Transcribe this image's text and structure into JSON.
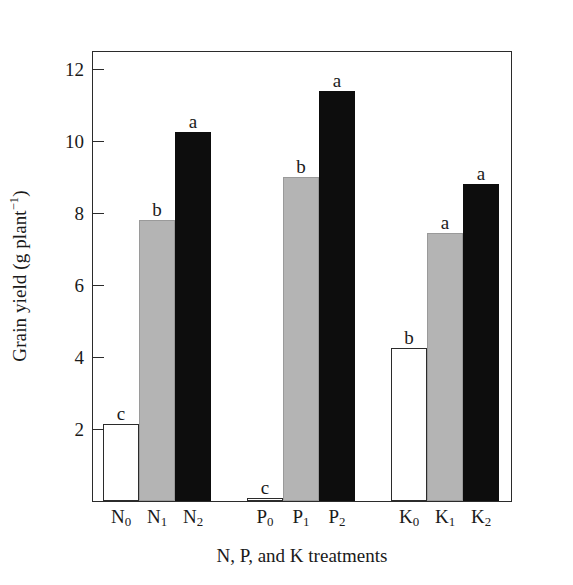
{
  "chart_data": {
    "type": "bar",
    "title": "",
    "xlabel": "N, P, and K treatments",
    "ylabel": "Grain yield (g plant",
    "ylabel_sup": "−1",
    "ylabel_tail": ")",
    "ylabel_plain": "Grain yield (g plant⁻¹)",
    "ylim": [
      0,
      12.5
    ],
    "yticks": [
      2,
      4,
      6,
      8,
      10,
      12
    ],
    "ytick_labels": [
      "2",
      "4",
      "6",
      "8",
      "10",
      "12"
    ],
    "grid": false,
    "legend": "none",
    "categories": [
      "N0",
      "N1",
      "N2",
      "P0",
      "P1",
      "P2",
      "K0",
      "K1",
      "K2"
    ],
    "category_labels": [
      {
        "base": "N",
        "sub": "0"
      },
      {
        "base": "N",
        "sub": "1"
      },
      {
        "base": "N",
        "sub": "2"
      },
      {
        "base": "P",
        "sub": "0"
      },
      {
        "base": "P",
        "sub": "1"
      },
      {
        "base": "P",
        "sub": "2"
      },
      {
        "base": "K",
        "sub": "0"
      },
      {
        "base": "K",
        "sub": "1"
      },
      {
        "base": "K",
        "sub": "2"
      }
    ],
    "values": [
      2.15,
      7.8,
      10.25,
      0.08,
      9.0,
      11.4,
      4.25,
      7.45,
      8.8
    ],
    "annotations": [
      "c",
      "b",
      "a",
      "c",
      "b",
      "a",
      "b",
      "a",
      "a"
    ],
    "fills": [
      "white",
      "gray",
      "black",
      "white",
      "gray",
      "black",
      "white",
      "gray",
      "black"
    ],
    "colors": {
      "white": "#ffffff",
      "gray": "#b4b4b4",
      "black": "#0d0d0d",
      "axis": "#2b2b2b",
      "text": "#1a1a1a"
    },
    "groups": [
      {
        "name": "N",
        "categories": [
          "N0",
          "N1",
          "N2"
        ]
      },
      {
        "name": "P",
        "categories": [
          "P0",
          "P1",
          "P2"
        ]
      },
      {
        "name": "K",
        "categories": [
          "K0",
          "K1",
          "K2"
        ]
      }
    ],
    "bars": [
      {
        "label": "N0",
        "base": "N",
        "sub": "0",
        "value": 2.15,
        "letter": "c",
        "fill": "white",
        "x": 10,
        "w": 36
      },
      {
        "label": "N1",
        "base": "N",
        "sub": "1",
        "value": 7.8,
        "letter": "b",
        "fill": "gray",
        "x": 46,
        "w": 36
      },
      {
        "label": "N2",
        "base": "N",
        "sub": "2",
        "value": 10.25,
        "letter": "a",
        "fill": "black",
        "x": 82,
        "w": 36
      },
      {
        "label": "P0",
        "base": "P",
        "sub": "0",
        "value": 0.08,
        "letter": "c",
        "fill": "white",
        "x": 154,
        "w": 36
      },
      {
        "label": "P1",
        "base": "P",
        "sub": "1",
        "value": 9.0,
        "letter": "b",
        "fill": "gray",
        "x": 190,
        "w": 36
      },
      {
        "label": "P2",
        "base": "P",
        "sub": "2",
        "value": 11.4,
        "letter": "a",
        "fill": "black",
        "x": 226,
        "w": 36
      },
      {
        "label": "K0",
        "base": "K",
        "sub": "0",
        "value": 4.25,
        "letter": "b",
        "fill": "white",
        "x": 298,
        "w": 36
      },
      {
        "label": "K1",
        "base": "K",
        "sub": "1",
        "value": 7.45,
        "letter": "a",
        "fill": "gray",
        "x": 334,
        "w": 36
      },
      {
        "label": "K2",
        "base": "K",
        "sub": "2",
        "value": 8.8,
        "letter": "a",
        "fill": "black",
        "x": 370,
        "w": 36
      }
    ]
  }
}
